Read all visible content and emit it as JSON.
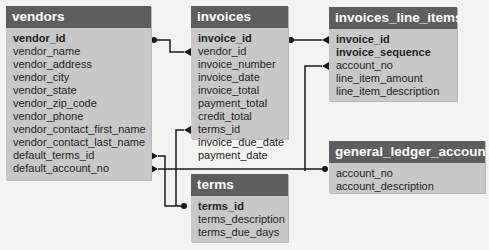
{
  "tables": {
    "vendors": {
      "name": "vendors",
      "columns": [
        {
          "name": "vendor_id",
          "key": "primary"
        },
        {
          "name": "vendor_name",
          "key": ""
        },
        {
          "name": "vendor_address",
          "key": ""
        },
        {
          "name": "vendor_city",
          "key": ""
        },
        {
          "name": "vendor_state",
          "key": ""
        },
        {
          "name": "vendor_zip_code",
          "key": ""
        },
        {
          "name": "vendor_phone",
          "key": ""
        },
        {
          "name": "vendor_contact_first_name",
          "key": ""
        },
        {
          "name": "vendor_contact_last_name",
          "key": ""
        },
        {
          "name": "default_terms_id",
          "key": "foreign"
        },
        {
          "name": "default_account_no",
          "key": "foreign"
        }
      ]
    },
    "invoices": {
      "name": "invoices",
      "columns": [
        {
          "name": "invoice_id",
          "key": "primary"
        },
        {
          "name": "vendor_id",
          "key": "foreign"
        },
        {
          "name": "invoice_number",
          "key": ""
        },
        {
          "name": "invoice_date",
          "key": ""
        },
        {
          "name": "invoice_total",
          "key": ""
        },
        {
          "name": "payment_total",
          "key": ""
        },
        {
          "name": "credit_total",
          "key": ""
        },
        {
          "name": "terms_id",
          "key": "foreign"
        },
        {
          "name": "invoice_due_date",
          "key": ""
        },
        {
          "name": "payment_date",
          "key": ""
        }
      ]
    },
    "invoices_line_items": {
      "name": "invoices_line_items",
      "columns": [
        {
          "name": "invoice_id",
          "key": "primary"
        },
        {
          "name": "invoice_sequence",
          "key": "primary"
        },
        {
          "name": "account_no",
          "key": "foreign"
        },
        {
          "name": "line_item_amount",
          "key": ""
        },
        {
          "name": "line_item_description",
          "key": ""
        }
      ]
    },
    "general_ledger_accounts": {
      "name": "general_ledger_accounts",
      "columns": [
        {
          "name": "account_no",
          "key": "primary"
        },
        {
          "name": "account_description",
          "key": ""
        }
      ]
    },
    "terms": {
      "name": "terms",
      "columns": [
        {
          "name": "terms_id",
          "key": "primary"
        },
        {
          "name": "terms_description",
          "key": ""
        },
        {
          "name": "terms_due_days",
          "key": ""
        }
      ]
    }
  },
  "relationships": [
    {
      "from": "vendors.vendor_id",
      "to": "invoices.vendor_id",
      "type": "one-to-many"
    },
    {
      "from": "invoices.invoice_id",
      "to": "invoices_line_items.invoice_id",
      "type": "one-to-many"
    },
    {
      "from": "general_ledger_accounts.account_no",
      "to": "invoices_line_items.account_no",
      "type": "one-to-many"
    },
    {
      "from": "general_ledger_accounts.account_no",
      "to": "vendors.default_account_no",
      "type": "one-to-many"
    },
    {
      "from": "terms.terms_id",
      "to": "invoices.terms_id",
      "type": "one-to-many"
    },
    {
      "from": "terms.terms_id",
      "to": "vendors.default_terms_id",
      "type": "one-to-many"
    }
  ],
  "colors": {
    "background": "#f3f3f1",
    "header": "#5e5e5e",
    "body": "#c8c8c8",
    "line": "#1a1a1a"
  }
}
